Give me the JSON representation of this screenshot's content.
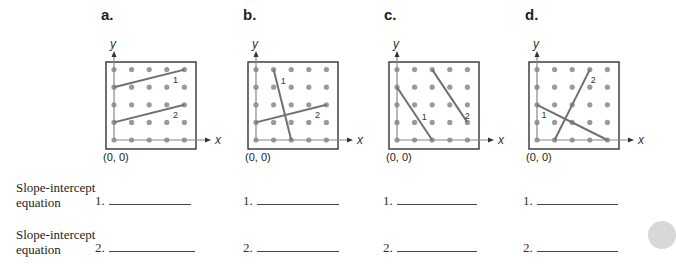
{
  "colors": {
    "dot": "#9a9a9a",
    "axis": "#888888",
    "line": "#707070",
    "frame": "#333333",
    "text": "#1e1e1e",
    "tab": "#d8d8d8"
  },
  "grid": {
    "cols": 5,
    "rows": 5,
    "step_px": 17.6
  },
  "panels": [
    {
      "id": "a",
      "label": "a.",
      "y_axis_label": "y",
      "x_axis_label": "x",
      "origin_label": "(0, 0)",
      "lines": [
        {
          "name": "1",
          "from": [
            0,
            3
          ],
          "to": [
            4,
            4
          ],
          "label_pos": [
            3.35,
            3.45
          ]
        },
        {
          "name": "2",
          "from": [
            0,
            1
          ],
          "to": [
            4,
            2
          ],
          "label_pos": [
            3.35,
            1.45
          ]
        }
      ]
    },
    {
      "id": "b",
      "label": "b.",
      "y_axis_label": "y",
      "x_axis_label": "x",
      "origin_label": "(0, 0)",
      "lines": [
        {
          "name": "1",
          "from": [
            1,
            4
          ],
          "to": [
            2,
            0
          ],
          "label_pos": [
            1.4,
            3.4
          ]
        },
        {
          "name": "2",
          "from": [
            0,
            1
          ],
          "to": [
            4,
            2
          ],
          "label_pos": [
            3.35,
            1.45
          ]
        }
      ]
    },
    {
      "id": "c",
      "label": "c.",
      "y_axis_label": "y",
      "x_axis_label": "x",
      "origin_label": "(0, 0)",
      "lines": [
        {
          "name": "1",
          "from": [
            0,
            3
          ],
          "to": [
            2,
            0
          ],
          "label_pos": [
            1.4,
            1.35
          ]
        },
        {
          "name": "2",
          "from": [
            2,
            4
          ],
          "to": [
            4,
            1
          ],
          "label_pos": [
            3.85,
            1.4
          ]
        }
      ]
    },
    {
      "id": "d",
      "label": "d.",
      "y_axis_label": "y",
      "x_axis_label": "x",
      "origin_label": "(0, 0)",
      "lines": [
        {
          "name": "1",
          "from": [
            0,
            2
          ],
          "to": [
            4,
            0
          ],
          "label_pos": [
            0.25,
            1.45
          ]
        },
        {
          "name": "2",
          "from": [
            1,
            0
          ],
          "to": [
            3,
            4
          ],
          "label_pos": [
            3.05,
            3.45
          ]
        }
      ]
    }
  ],
  "rows": [
    {
      "label_line1": "Slope-intercept",
      "label_line2": "equation",
      "number": "1."
    },
    {
      "label_line1": "Slope-intercept",
      "label_line2": "equation",
      "number": "2."
    }
  ]
}
